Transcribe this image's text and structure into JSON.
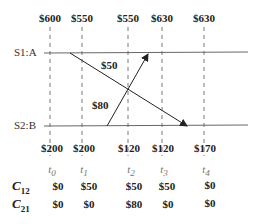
{
  "diagram": {
    "processes": [
      {
        "label": "S1:A",
        "y": 53
      },
      {
        "label": "S2:B",
        "y": 126
      }
    ],
    "time_columns": [
      {
        "t": "t",
        "sub": "0",
        "x": 50,
        "s1_value": "$600",
        "s2_value": "$200",
        "c12": "$0",
        "c21": "$0"
      },
      {
        "t": "t",
        "sub": "1",
        "x": 82,
        "s1_value": "$550",
        "s2_value": "$200",
        "c12": "$50",
        "c21": "$0"
      },
      {
        "t": "t",
        "sub": "2",
        "x": 128,
        "s1_value": "$550",
        "s2_value": "$120",
        "c12": "$50",
        "c21": "$80"
      },
      {
        "t": "t",
        "sub": "3",
        "x": 162,
        "s1_value": "$630",
        "s2_value": "$120",
        "c12": "$50",
        "c21": "$0"
      },
      {
        "t": "t",
        "sub": "4",
        "x": 204,
        "s1_value": "$630",
        "s2_value": "$170",
        "c12": "$0",
        "c21": "$0"
      }
    ],
    "messages": [
      {
        "label": "$50",
        "from": "S1:A",
        "to": "S2:B"
      },
      {
        "label": "$80",
        "from": "S2:B",
        "to": "S1:A"
      }
    ],
    "channel_rows": [
      {
        "name": "C",
        "sub": "12"
      },
      {
        "name": "C",
        "sub": "21"
      }
    ]
  }
}
